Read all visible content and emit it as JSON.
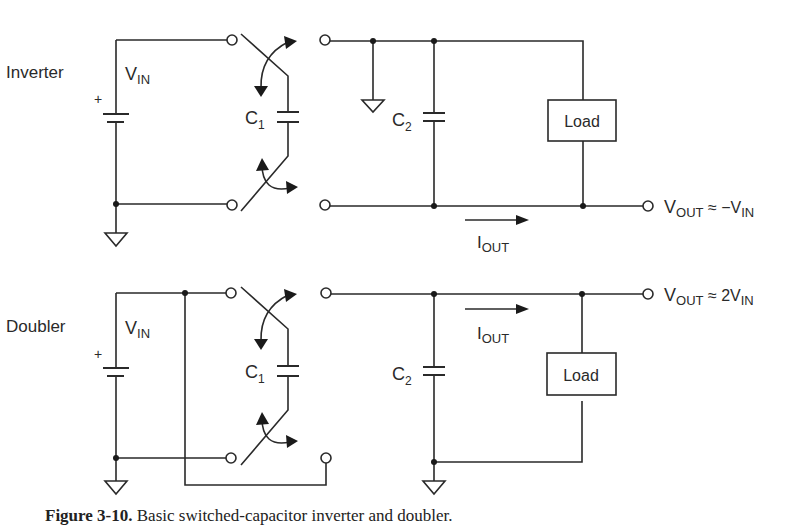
{
  "figure": {
    "caption_number": "Figure 3-10.",
    "caption_text": "Basic switched-capacitor inverter and doubler.",
    "colors": {
      "line": "#2a2a2a",
      "background": "#ffffff"
    }
  },
  "inverter": {
    "title": "Inverter",
    "source_label": "V",
    "source_sub": "IN",
    "plus_sign": "+",
    "flying_cap": "C",
    "flying_cap_sub": "1",
    "output_cap": "C",
    "output_cap_sub": "2",
    "load_label": "Load",
    "current_label": "I",
    "current_sub": "OUT",
    "output_label": "V",
    "output_sub": "OUT",
    "output_relation": " ≈ −V",
    "output_relation_sub": "IN"
  },
  "doubler": {
    "title": "Doubler",
    "source_label": "V",
    "source_sub": "IN",
    "plus_sign": "+",
    "flying_cap": "C",
    "flying_cap_sub": "1",
    "output_cap": "C",
    "output_cap_sub": "2",
    "load_label": "Load",
    "current_label": "I",
    "current_sub": "OUT",
    "output_label": "V",
    "output_sub": "OUT",
    "output_relation": " ≈ 2V",
    "output_relation_sub": "IN"
  }
}
